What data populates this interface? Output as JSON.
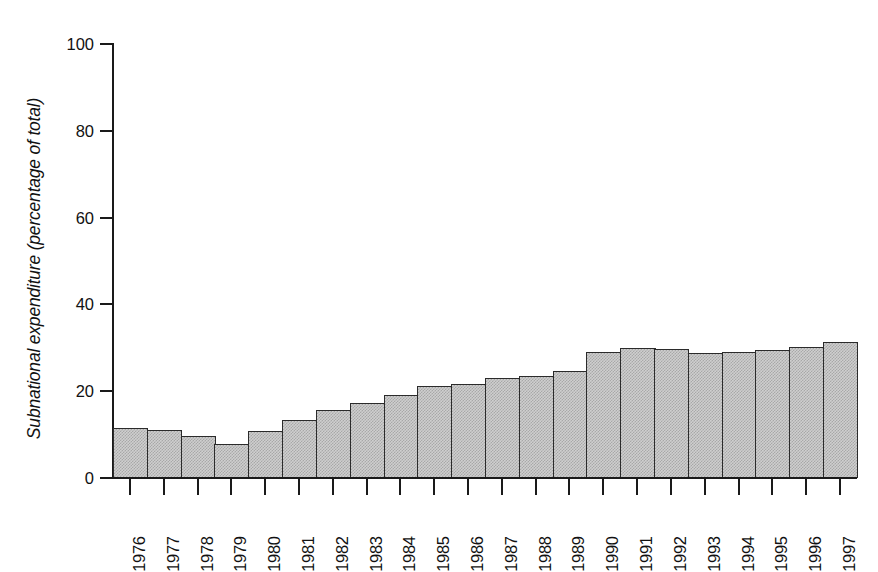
{
  "chart_data": {
    "type": "bar",
    "title": "",
    "subtitle": "",
    "xlabel": "",
    "ylabel": "Subnational expenditure (percentage of total)",
    "ylim": [
      0,
      100
    ],
    "yticks": [
      0,
      20,
      40,
      60,
      80,
      100
    ],
    "ytick_labels": [
      "0",
      "20",
      "40",
      "60",
      "80",
      "100"
    ],
    "grid": false,
    "legend": null,
    "categories": [
      "1976",
      "1977",
      "1978",
      "1979",
      "1980",
      "1981",
      "1982",
      "1983",
      "1984",
      "1985",
      "1986",
      "1987",
      "1988",
      "1989",
      "1990",
      "1991",
      "1992",
      "1993",
      "1994",
      "1995",
      "1996",
      "1997"
    ],
    "values": [
      11.5,
      11.0,
      9.7,
      7.8,
      10.8,
      13.4,
      15.6,
      17.3,
      19.1,
      21.2,
      21.7,
      23.0,
      23.5,
      24.6,
      29.0,
      30.0,
      29.8,
      28.8,
      29.0,
      29.5,
      30.2,
      31.3
    ],
    "series": [
      {
        "name": "Subnational expenditure",
        "values": [
          11.5,
          11.0,
          9.7,
          7.8,
          10.8,
          13.4,
          15.6,
          17.3,
          19.1,
          21.2,
          21.7,
          23.0,
          23.5,
          24.6,
          29.0,
          30.0,
          29.8,
          28.8,
          29.0,
          29.5,
          30.2,
          31.3
        ]
      }
    ],
    "bar_fill_color": "#cfcfcf",
    "bar_edge_color": "#2b2b2b",
    "axis_color": "#1a1a1a"
  },
  "caption": {
    "clipped_text": ""
  }
}
